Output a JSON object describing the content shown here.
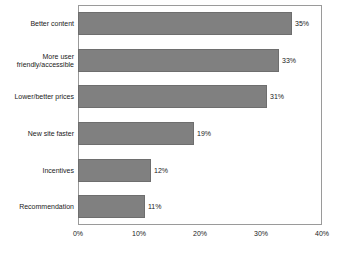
{
  "chart_data": {
    "type": "bar",
    "orientation": "horizontal",
    "title": "",
    "xlabel": "",
    "ylabel": "",
    "xlim": [
      0,
      40
    ],
    "xticks": [
      "0%",
      "10%",
      "20%",
      "30%",
      "40%"
    ],
    "xtick_values": [
      0,
      10,
      20,
      30,
      40
    ],
    "grid": false,
    "legend": false,
    "categories": [
      "Better content",
      "More user\nfriendly/accessible",
      "Lower/better prices",
      "New site faster",
      "Incentives",
      "Recommendation"
    ],
    "values": [
      35,
      33,
      31,
      19,
      12,
      11
    ],
    "value_labels": [
      "35%",
      "33%",
      "31%",
      "19%",
      "12%",
      "11%"
    ],
    "colors": {
      "bar_fill": "#808080",
      "bar_edge": "#6e6e6e",
      "plot_border": "#9a9a9a",
      "text": "#1a1a1a",
      "background": "#ffffff"
    }
  }
}
